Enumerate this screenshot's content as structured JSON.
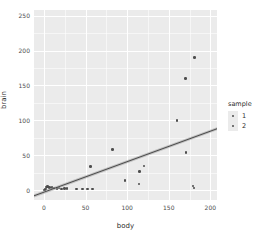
{
  "chart_data": {
    "type": "scatter",
    "title": "",
    "xlabel": "body",
    "ylabel": "brain",
    "xlim": [
      -12,
      208
    ],
    "ylim": [
      -14,
      258
    ],
    "xticks": [
      0,
      50,
      100,
      150,
      200
    ],
    "yticks": [
      0,
      50,
      100,
      150,
      200,
      250
    ],
    "xticklabels": [
      "0",
      "50",
      "100",
      "150",
      "200"
    ],
    "yticklabels": [
      "0",
      "50",
      "100",
      "150",
      "200",
      "250"
    ],
    "grid": true,
    "grid_color": "#FFFFFF",
    "panel_color": "#EBEBEB",
    "point_color": "#4D4D4D",
    "line_color": "#3C3C3C",
    "legend": {
      "title": "sample",
      "position": "right",
      "entries": [
        {
          "label": "1",
          "color": "#4D4D4D"
        },
        {
          "label": "2",
          "color": "#4D4D4D"
        }
      ]
    },
    "points": [
      {
        "x": 0.6,
        "y": 0.4,
        "sample": "1"
      },
      {
        "x": 1.4,
        "y": 1.2,
        "sample": "1"
      },
      {
        "x": 2.5,
        "y": 1.6,
        "sample": "1"
      },
      {
        "x": 3.3,
        "y": 4.5,
        "sample": "1"
      },
      {
        "x": 4.2,
        "y": 5.0,
        "sample": "1"
      },
      {
        "x": 6.8,
        "y": 3.8,
        "sample": "1"
      },
      {
        "x": 9.5,
        "y": 4.2,
        "sample": "1"
      },
      {
        "x": 12.0,
        "y": 3.0,
        "sample": "1"
      },
      {
        "x": 15.5,
        "y": 2.6,
        "sample": "2"
      },
      {
        "x": 18.0,
        "y": 3.2,
        "sample": "2"
      },
      {
        "x": 21.0,
        "y": 2.0,
        "sample": "2"
      },
      {
        "x": 24.5,
        "y": 2.2,
        "sample": "2"
      },
      {
        "x": 27.5,
        "y": 2.4,
        "sample": "2"
      },
      {
        "x": 39.0,
        "y": 2.0,
        "sample": "2"
      },
      {
        "x": 46.0,
        "y": 1.8,
        "sample": "2"
      },
      {
        "x": 52.5,
        "y": 2.0,
        "sample": "2"
      },
      {
        "x": 58.5,
        "y": 2.0,
        "sample": "2"
      },
      {
        "x": 56.0,
        "y": 34.0,
        "sample": "2"
      },
      {
        "x": 82.5,
        "y": 58.5,
        "sample": "2"
      },
      {
        "x": 97.5,
        "y": 13.5,
        "sample": "2"
      },
      {
        "x": 114.0,
        "y": 9.0,
        "sample": "2"
      },
      {
        "x": 114.5,
        "y": 27.0,
        "sample": "2"
      },
      {
        "x": 120.0,
        "y": 34.5,
        "sample": "2"
      },
      {
        "x": 160.0,
        "y": 99.5,
        "sample": "2"
      },
      {
        "x": 170.5,
        "y": 54.0,
        "sample": "2"
      },
      {
        "x": 170.0,
        "y": 160.0,
        "sample": "2"
      },
      {
        "x": 181.0,
        "y": 190.0,
        "sample": "2"
      },
      {
        "x": 179.0,
        "y": 6.0,
        "sample": "2"
      },
      {
        "x": 180.5,
        "y": 3.0,
        "sample": "2"
      }
    ],
    "fit_line": {
      "type": "linear",
      "x_start": -12,
      "y_start": -8,
      "x_end": 208,
      "y_end": 88,
      "has_confidence_band": true
    }
  }
}
